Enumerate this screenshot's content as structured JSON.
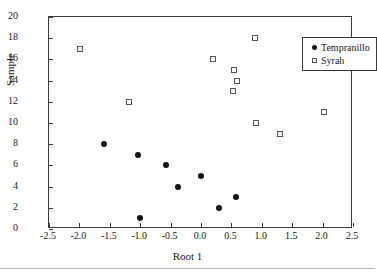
{
  "chart_data": {
    "type": "scatter",
    "title": "",
    "xlabel": "Root 1",
    "ylabel": "Sample",
    "xlim": [
      -2.5,
      2.5
    ],
    "ylim": [
      0,
      20
    ],
    "xticks": [
      "-2.5",
      "-2.0",
      "-1.5",
      "-1.0",
      "-0.5",
      "0.0",
      "0.5",
      "1.0",
      "1.5",
      "2.0",
      "2.5"
    ],
    "xtick_values": [
      -2.5,
      -2.0,
      -1.5,
      -1.0,
      -0.5,
      0.0,
      0.5,
      1.0,
      1.5,
      2.0,
      2.5
    ],
    "yticks": [
      "0",
      "2",
      "4",
      "6",
      "8",
      "10",
      "12",
      "14",
      "16",
      "18",
      "20"
    ],
    "ytick_values": [
      0,
      2,
      4,
      6,
      8,
      10,
      12,
      14,
      16,
      18,
      20
    ],
    "grid": false,
    "legend_position": "upper right",
    "series": [
      {
        "name": "Tempranillo",
        "marker": "filled-circle",
        "color": "#111111",
        "points": [
          {
            "x": -1.6,
            "y": 8
          },
          {
            "x": -1.03,
            "y": 7
          },
          {
            "x": -0.58,
            "y": 6
          },
          {
            "x": -0.38,
            "y": 4
          },
          {
            "x": 0.0,
            "y": 5
          },
          {
            "x": 0.3,
            "y": 2
          },
          {
            "x": 0.58,
            "y": 3
          },
          {
            "x": -1.0,
            "y": 1
          }
        ]
      },
      {
        "name": "Syrah",
        "marker": "open-square",
        "color": "#555555",
        "points": [
          {
            "x": -1.99,
            "y": 17
          },
          {
            "x": -1.18,
            "y": 12
          },
          {
            "x": 0.19,
            "y": 16
          },
          {
            "x": 0.55,
            "y": 15
          },
          {
            "x": 0.6,
            "y": 14
          },
          {
            "x": 0.53,
            "y": 13
          },
          {
            "x": 0.88,
            "y": 18
          },
          {
            "x": 0.9,
            "y": 10
          },
          {
            "x": 1.3,
            "y": 9
          },
          {
            "x": 2.02,
            "y": 11
          }
        ]
      }
    ]
  },
  "legend": {
    "entries": [
      {
        "label": "Tempranillo",
        "marker": "filled-circle"
      },
      {
        "label": "Syrah",
        "marker": "open-square"
      }
    ]
  }
}
